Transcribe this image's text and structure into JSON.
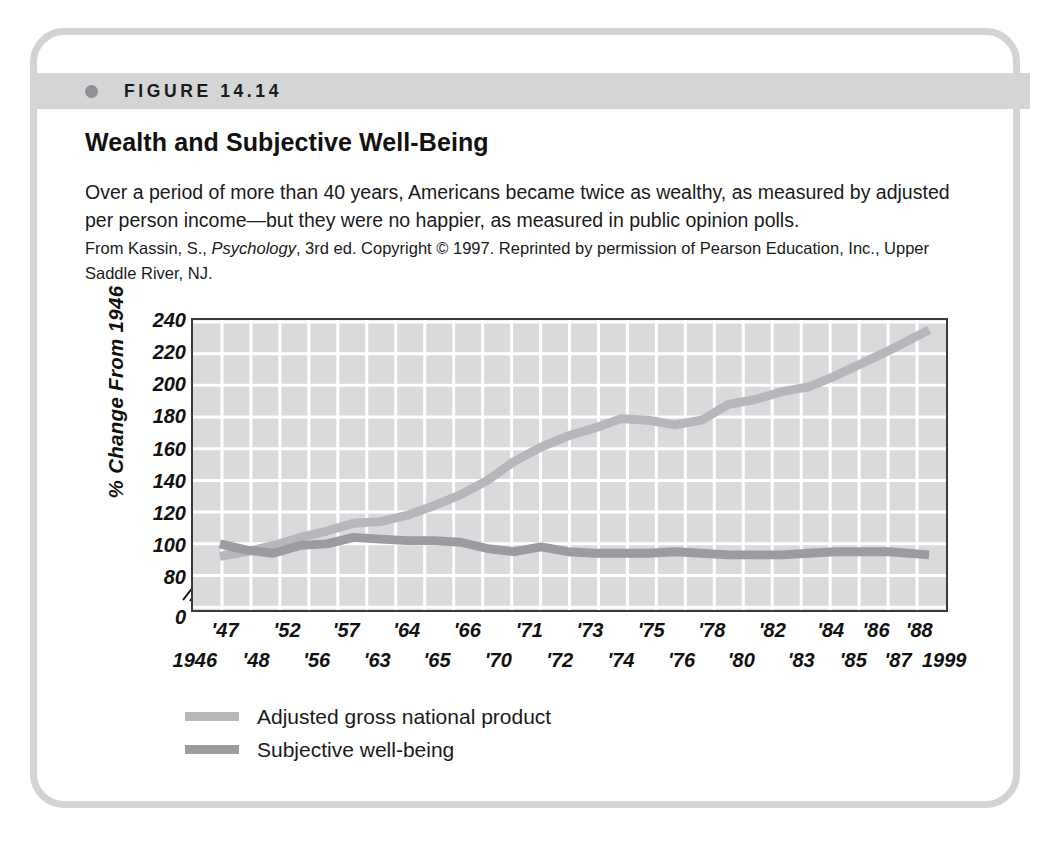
{
  "figure": {
    "number_label": "FIGURE 14.14",
    "bullet_icon": "bullet-dot-icon",
    "title": "Wealth and Subjective Well-Being",
    "caption_main": "Over a period of more than 40 years, Americans became twice as wealthy, as measured by adjusted per person income—but they were no happier, as measured in public opinion polls.",
    "credit_prefix": "From Kassin, S., ",
    "credit_italic": "Psychology",
    "credit_suffix": ", 3rd ed. Copyright © 1997. Reprinted by permission of Pearson Education, Inc., Upper Saddle River, NJ.",
    "frame_color": "#d2d3d5",
    "band_color": "#d4d5d7"
  },
  "chart_data": {
    "type": "line",
    "title": "Wealth and Subjective Well-Being",
    "xlabel": "",
    "ylabel": "% Change From 1946",
    "ylim": [
      80,
      240
    ],
    "y_ticks": [
      240,
      220,
      200,
      180,
      160,
      140,
      120,
      100,
      80,
      0
    ],
    "axis_break": true,
    "axis_break_between": [
      80,
      0
    ],
    "grid": true,
    "grid_color": "#ffffff",
    "plot_background": "#d9dadc",
    "legend_position": "below-left",
    "x_labels_top": [
      "'47",
      "'52",
      "'57",
      "'64",
      "'66",
      "'71",
      "'73",
      "'75",
      "'78",
      "'82",
      "'84",
      "'86",
      "'88"
    ],
    "x_labels_bottom": [
      "1946",
      "'48",
      "'56",
      "'63",
      "'65",
      "'70",
      "'72",
      "'74",
      "'76",
      "'80",
      "'83",
      "'85",
      "'87",
      "1999"
    ],
    "x_labels_top_positions": [
      0.045,
      0.127,
      0.205,
      0.285,
      0.365,
      0.447,
      0.527,
      0.608,
      0.688,
      0.768,
      0.845,
      0.905,
      0.962
    ],
    "x_labels_bottom_positions": [
      0.005,
      0.086,
      0.166,
      0.246,
      0.325,
      0.406,
      0.487,
      0.568,
      0.648,
      0.727,
      0.806,
      0.875,
      0.934,
      0.995
    ],
    "x_years": [
      1946,
      1948,
      1950,
      1952,
      1954,
      1956,
      1958,
      1960,
      1962,
      1964,
      1966,
      1968,
      1970,
      1972,
      1974,
      1976,
      1978,
      1980,
      1982,
      1984,
      1986,
      1988,
      1990,
      1992,
      1994,
      1996,
      1999
    ],
    "series": [
      {
        "name": "Adjusted gross national product",
        "color": "#b5b7ba",
        "values": [
          92,
          95,
          99,
          104,
          108,
          113,
          114,
          118,
          124,
          131,
          140,
          152,
          161,
          168,
          173,
          179,
          178,
          175,
          178,
          188,
          191,
          196,
          199,
          206,
          214,
          222,
          235
        ]
      },
      {
        "name": "Subjective well-being",
        "color": "#9a9c9f",
        "values": [
          100,
          96,
          94,
          99,
          100,
          104,
          103,
          102,
          102,
          101,
          97,
          95,
          98,
          95,
          94,
          94,
          94,
          95,
          94,
          93,
          93,
          93,
          94,
          95,
          95,
          95,
          93
        ]
      }
    ],
    "legend": [
      {
        "label": "Adjusted gross national product",
        "color": "#b5b7ba"
      },
      {
        "label": "Subjective well-being",
        "color": "#9a9c9f"
      }
    ]
  }
}
